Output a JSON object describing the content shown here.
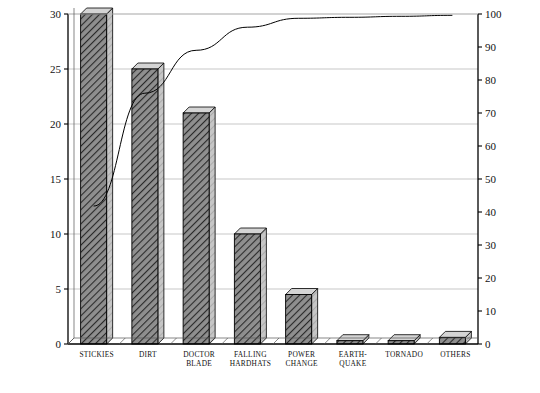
{
  "chart_data": {
    "type": "bar",
    "title": "",
    "xlabel": "Cause of lost production or unscheduled down time",
    "ylabel": "Percent of total loss or down time",
    "ylabel_secondary": "Cummulative percent of down time",
    "categories": [
      "STICKIES",
      "DIRT",
      "DOCTOR BLADE",
      "FALLING HARDHATS",
      "POWER CHANGE",
      "EARTH-QUAKE",
      "TORNADO",
      "OTHERS"
    ],
    "category_lines": [
      [
        "STICKIES",
        ""
      ],
      [
        "DIRT",
        ""
      ],
      [
        "DOCTOR",
        "BLADE"
      ],
      [
        "FALLING",
        "HARDHATS"
      ],
      [
        "POWER",
        "CHANGE"
      ],
      [
        "EARTH-",
        "QUAKE"
      ],
      [
        "TORNADO",
        ""
      ],
      [
        "OTHERS",
        ""
      ]
    ],
    "values": [
      30.0,
      25.0,
      21.0,
      10.0,
      4.5,
      0.3,
      0.3,
      0.6
    ],
    "cumulative": [
      41.8,
      76.0,
      89.0,
      96.0,
      98.7,
      99.0,
      99.3,
      99.6
    ],
    "ylim": [
      0,
      30
    ],
    "yticks": [
      0,
      5,
      10,
      15,
      20,
      25,
      30
    ],
    "ylim_secondary": [
      0,
      100
    ],
    "yticks_secondary": [
      0,
      10,
      20,
      30,
      40,
      50,
      60,
      70,
      80,
      90,
      100
    ],
    "grid": true,
    "legend": "none",
    "series": [
      {
        "name": "Percent of total loss or down time",
        "type": "bar",
        "values": [
          30.0,
          25.0,
          21.0,
          10.0,
          4.5,
          0.3,
          0.3,
          0.6
        ]
      },
      {
        "name": "Cummulative percent of down time",
        "type": "line",
        "values": [
          41.8,
          76.0,
          89.0,
          96.0,
          98.7,
          99.0,
          99.3,
          99.6
        ]
      }
    ],
    "colors": {
      "bar_fill": "#8c8c8c",
      "bar_hatch": "#303030",
      "bar_side": "#bdbdbd",
      "bar_edge": "#000000",
      "line": "#000000",
      "grid": "#b9b9b9",
      "axis": "#000000",
      "background": "#ffffff"
    }
  }
}
